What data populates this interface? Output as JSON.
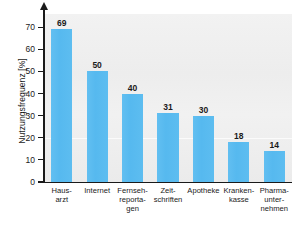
{
  "chart_data": {
    "type": "bar",
    "title": "",
    "subtitle": "",
    "xlabel": "",
    "ylabel": "Nutzungsfrequenz [%]",
    "ylim": [
      0,
      76
    ],
    "yticks": [
      0,
      10,
      20,
      30,
      40,
      50,
      60,
      70
    ],
    "ytick_labels": [
      "0",
      "10",
      "20",
      "30",
      "40",
      "50",
      "60",
      "70"
    ],
    "grid": false,
    "legend": null,
    "categories": [
      "Haus-\narzt",
      "Internet",
      "Fernseh-\nreporta-\ngen",
      "Zeit-\nschriften",
      "Apotheke",
      "Kranken-\nkasse",
      "Pharma-\nunter-\nnehmen"
    ],
    "category_plain": [
      "Hausarzt",
      "Internet",
      "Fernsehreportagen",
      "Zeitschriften",
      "Apotheke",
      "Krankenkasse",
      "Pharmaunternehmen"
    ],
    "values": [
      69,
      50,
      40,
      31,
      30,
      18,
      14
    ],
    "value_labels": [
      "69",
      "50",
      "40",
      "31",
      "30",
      "18",
      "14"
    ],
    "bar_color": "#5cbcf0",
    "plot_background": "#efefef",
    "axis_color": "#1a1a1a",
    "text_color": "#1a1a1a"
  }
}
